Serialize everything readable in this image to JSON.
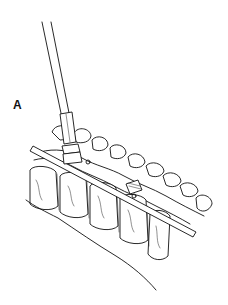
{
  "figure": {
    "panel_label": "A",
    "colors": {
      "line": "#111111",
      "background": "#ffffff"
    }
  }
}
